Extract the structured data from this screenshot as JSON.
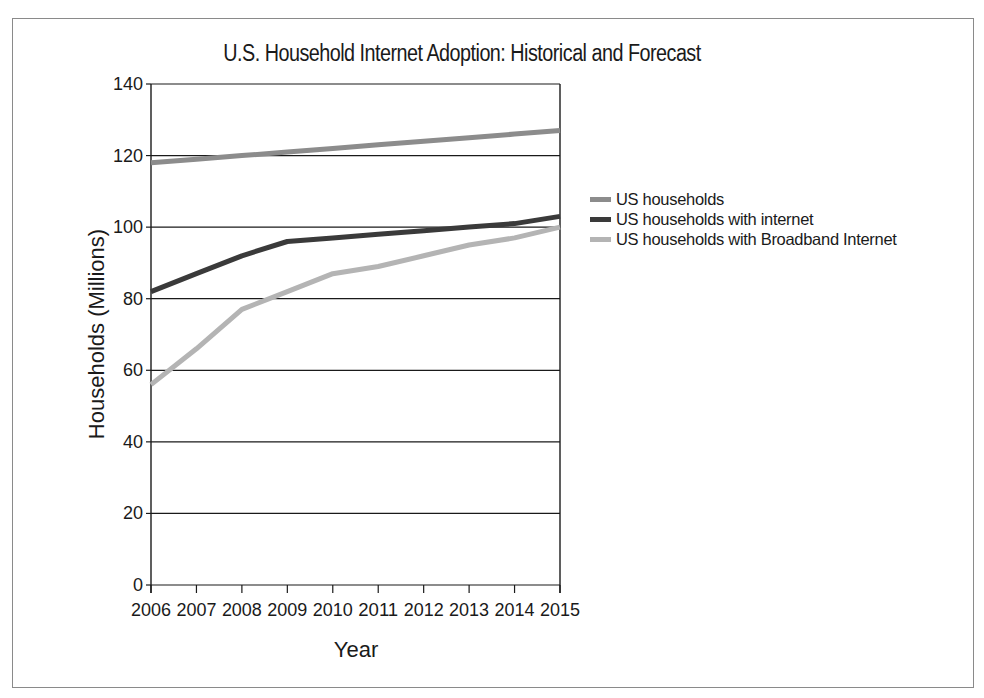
{
  "chart_data": {
    "type": "line",
    "title": "U.S. Household Internet Adoption: Historical and Forecast",
    "xlabel": "Year",
    "ylabel": "Households (Millions)",
    "categories": [
      "2006",
      "2007",
      "2008",
      "2009",
      "2010",
      "2011",
      "2012",
      "2013",
      "2014",
      "2015"
    ],
    "yticks": [
      "0",
      "20",
      "40",
      "60",
      "80",
      "100",
      "120",
      "140"
    ],
    "ylim": [
      0,
      140
    ],
    "grid": true,
    "legend_position": "right",
    "series": [
      {
        "name": "US households",
        "color": "#8c8c8c",
        "values": [
          118,
          119,
          120,
          121,
          122,
          123,
          124,
          125,
          126,
          127
        ]
      },
      {
        "name": "US households with internet",
        "color": "#3a3a3a",
        "values": [
          82,
          87,
          92,
          96,
          97,
          98,
          99,
          100,
          101,
          103
        ]
      },
      {
        "name": "US households with Broadband Internet",
        "color": "#b4b4b4",
        "values": [
          56,
          66,
          77,
          82,
          87,
          89,
          92,
          95,
          97,
          100
        ]
      }
    ]
  }
}
